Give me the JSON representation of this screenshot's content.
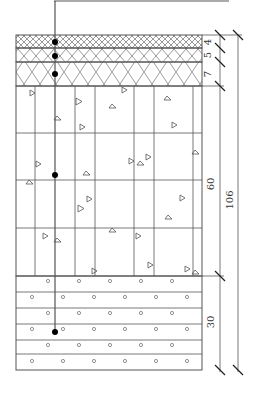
{
  "diagram": {
    "colors": {
      "line": "#555555",
      "dot": "#000000",
      "background": "#ffffff"
    },
    "layers": [
      {
        "name": "layer-1",
        "thickness": "4",
        "pattern": "fine-crosshatch"
      },
      {
        "name": "layer-2",
        "thickness": "5",
        "pattern": "medium-crosshatch"
      },
      {
        "name": "layer-3",
        "thickness": "7",
        "pattern": "coarse-crosshatch"
      },
      {
        "name": "layer-4",
        "thickness": "60",
        "pattern": "triangles-gravel"
      },
      {
        "name": "layer-5",
        "thickness": "30",
        "pattern": "circles-sand"
      }
    ],
    "total_thickness": "106",
    "sensors": [
      {
        "depth_label": "layer-1"
      },
      {
        "depth_label": "layer-2"
      },
      {
        "depth_label": "layer-3"
      },
      {
        "depth_label": "layer-4"
      },
      {
        "depth_label": "layer-5"
      }
    ]
  }
}
